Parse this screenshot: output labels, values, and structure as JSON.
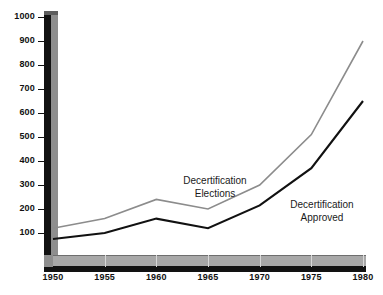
{
  "chart_data": {
    "type": "line",
    "title": "",
    "subtitle": "",
    "xlabel": "",
    "ylabel": "",
    "x": [
      1950,
      1955,
      1960,
      1965,
      1970,
      1975,
      1980
    ],
    "xticklabels": [
      "1950",
      "1955",
      "1960",
      "1965",
      "1970",
      "1975",
      "1980"
    ],
    "xlim": [
      1950,
      1980
    ],
    "ylim": [
      0,
      1000
    ],
    "yticks": [
      100,
      200,
      300,
      400,
      500,
      600,
      700,
      800,
      900,
      1000
    ],
    "yticklabels": [
      "100",
      "200",
      "300",
      "400",
      "500",
      "600",
      "700",
      "800",
      "900",
      "1000"
    ],
    "grid": false,
    "legend_position": "inline-annotation",
    "series": [
      {
        "name": "Decertification Elections",
        "color": "#8c8c8c",
        "values": [
          120,
          160,
          240,
          200,
          300,
          510,
          900
        ]
      },
      {
        "name": "Decertification Approved",
        "color": "#111111",
        "values": [
          75,
          100,
          160,
          120,
          215,
          370,
          650
        ]
      }
    ],
    "annotations": [
      {
        "name": "elections-annotation",
        "line1": "Decertification",
        "line2": "Elections",
        "x": 215,
        "y": 175
      },
      {
        "name": "approved-annotation",
        "line1": "Decertification",
        "line2": "Approved",
        "x": 322,
        "y": 199
      }
    ]
  }
}
